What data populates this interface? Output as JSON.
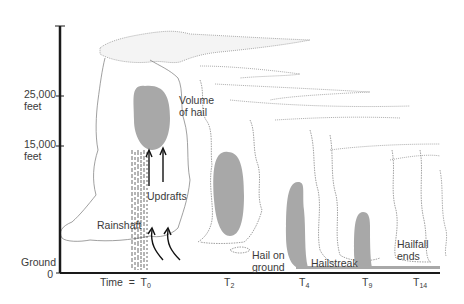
{
  "diagram": {
    "type": "hailstorm-evolution-over-time",
    "y_axis": {
      "ticks": [
        {
          "label_line1": "25,000",
          "label_line2": "feet"
        },
        {
          "label_line1": "15,000",
          "label_line2": "feet"
        },
        {
          "label_line1": "Ground",
          "label_line2": "0"
        }
      ]
    },
    "x_axis": {
      "prefix": "Time  =  ",
      "ticks": [
        {
          "base": "T",
          "sub": "0"
        },
        {
          "base": "T",
          "sub": "2"
        },
        {
          "base": "T",
          "sub": "4"
        },
        {
          "base": "T",
          "sub": "9"
        },
        {
          "base": "T",
          "sub": "14"
        }
      ]
    },
    "annotations": {
      "volume_of_hail_1": "Volume",
      "volume_of_hail_2": "of hail",
      "updrafts": "Updrafts",
      "rainshaft": "Rainshaft",
      "hail_on_ground_1": "Hail on",
      "hail_on_ground_2": "ground",
      "hailstreak": "Hailstreak",
      "hailfall_ends_1": "Hailfall",
      "hailfall_ends_2": "ends"
    },
    "colors": {
      "hail_fill": "#a8a8a8",
      "axis": "#1a1a1a",
      "cloud_outline": "#777777"
    }
  }
}
